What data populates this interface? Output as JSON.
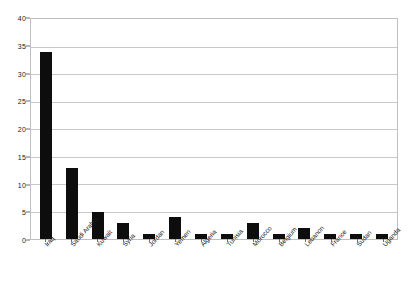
{
  "chart_data": {
    "type": "bar",
    "title": "",
    "subtitle": "",
    "xlabel": "",
    "ylabel": "",
    "ylim": [
      0,
      40
    ],
    "ytick_step": 5,
    "yticks": [
      0,
      5,
      10,
      15,
      20,
      25,
      30,
      35,
      40
    ],
    "grid": true,
    "grid_axis": "y",
    "legend": false,
    "legend_position": "none",
    "bar_color": "#0d0d0d",
    "grid_color": "#c9c9c9",
    "border_color": "#bfbfbf",
    "label_rotation_degrees": -48,
    "categories": [
      "Iraq",
      "Saudi Arabia",
      "Kuwait",
      "Syria",
      "Jordan",
      "Yemen",
      "Algeria",
      "Tunisia",
      "Morocco",
      "Belgium",
      "Lebanon",
      "France",
      "Sudan",
      "Uganda"
    ],
    "values": [
      34,
      13,
      5,
      3,
      1,
      4,
      1,
      1,
      3,
      1,
      2,
      1,
      1,
      1
    ]
  }
}
